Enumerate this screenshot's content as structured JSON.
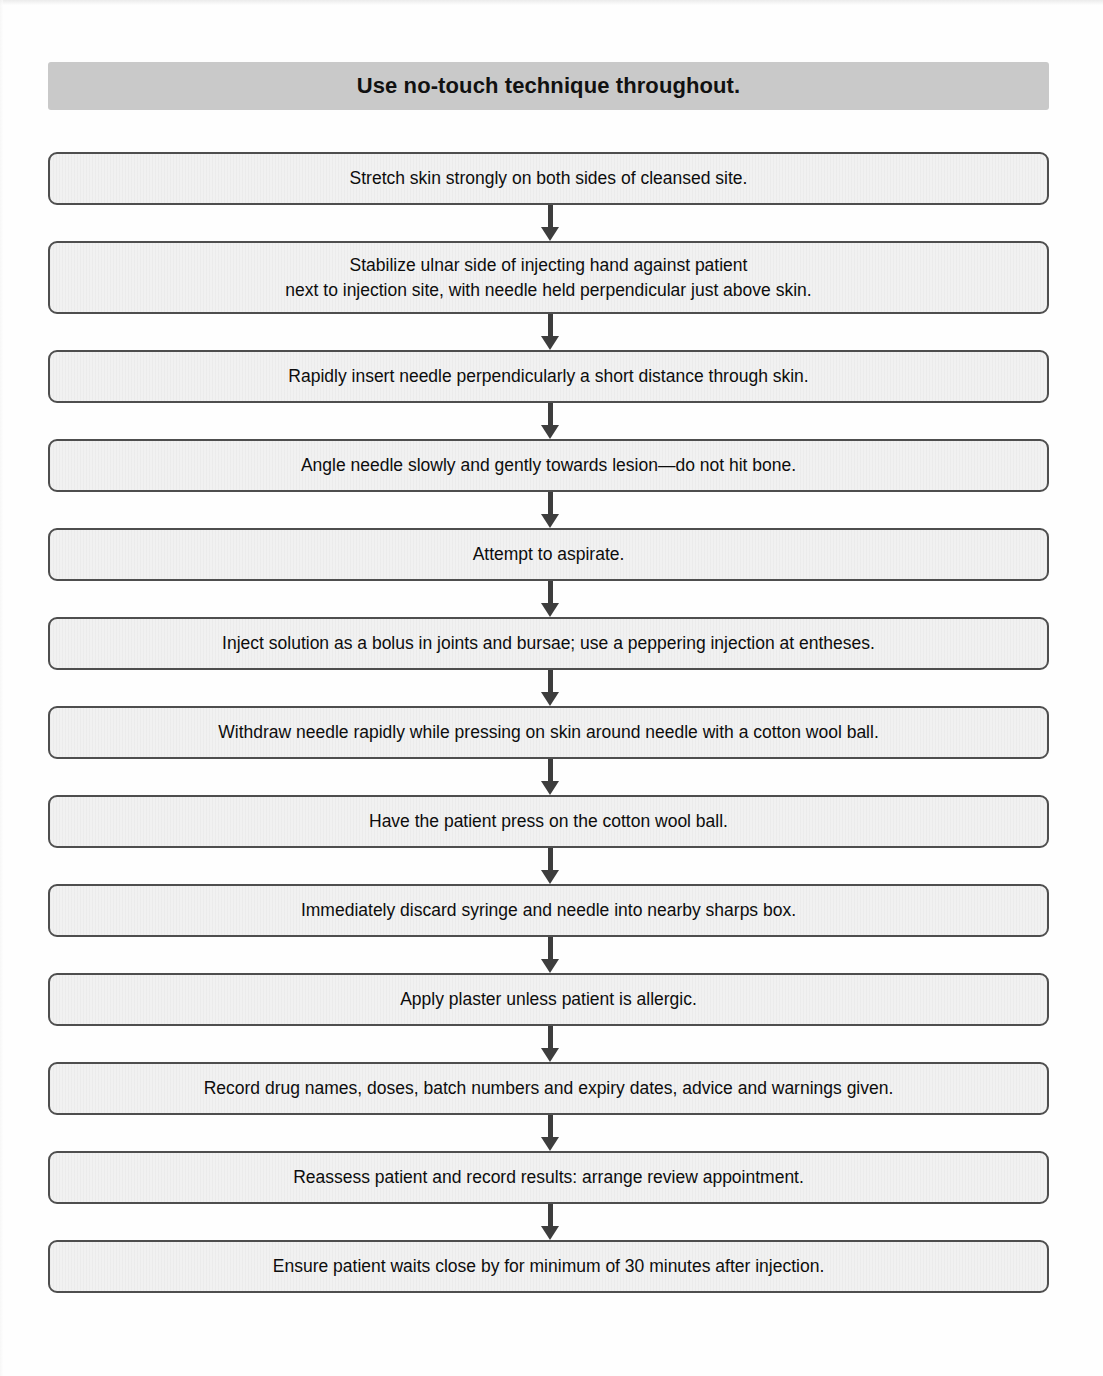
{
  "document": {
    "type": "clinical-procedure-flowchart",
    "title_banner": {
      "text": "Use no-touch technique throughout.",
      "background_color": "#c9c9c9",
      "text_color": "#111111"
    },
    "node_style": {
      "fill_color": "#f1f1f1",
      "border_color": "#4e4e4e",
      "text_color": "#0d0d0d"
    },
    "connector_style": {
      "color": "#3d3d3d",
      "direction": "down",
      "arrowhead": "solid-triangle"
    }
  },
  "flow": {
    "steps": [
      {
        "id": 1,
        "text": "Stretch skin strongly on both sides of cleansed site.",
        "lines": 1
      },
      {
        "id": 2,
        "text": "Stabilize ulnar side of injecting hand against patient\nnext to injection site, with needle held perpendicular just above skin.",
        "lines": 2
      },
      {
        "id": 3,
        "text": "Rapidly insert needle perpendicularly a short distance through skin.",
        "lines": 1
      },
      {
        "id": 4,
        "text": "Angle needle slowly and gently towards lesion—do not hit bone.",
        "lines": 1
      },
      {
        "id": 5,
        "text": "Attempt to aspirate.",
        "lines": 1
      },
      {
        "id": 6,
        "text": "Inject solution as a bolus in joints and bursae; use a peppering injection at entheses.",
        "lines": 1
      },
      {
        "id": 7,
        "text": "Withdraw needle rapidly while pressing on skin around needle with a cotton wool ball.",
        "lines": 1
      },
      {
        "id": 8,
        "text": "Have the patient press on the cotton wool ball.",
        "lines": 1
      },
      {
        "id": 9,
        "text": "Immediately discard syringe and needle into nearby sharps box.",
        "lines": 1
      },
      {
        "id": 10,
        "text": "Apply plaster unless patient is allergic.",
        "lines": 1
      },
      {
        "id": 11,
        "text": "Record drug names, doses, batch numbers and expiry dates, advice and warnings given.",
        "lines": 1
      },
      {
        "id": 12,
        "text": "Reassess patient and record results: arrange review appointment.",
        "lines": 1
      },
      {
        "id": 13,
        "text": "Ensure patient waits close by for minimum of 30 minutes after injection.",
        "lines": 1
      }
    ]
  }
}
